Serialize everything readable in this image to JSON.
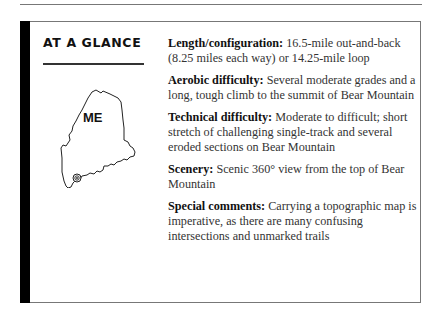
{
  "sidebar": {
    "heading": "AT A GLANCE",
    "map": {
      "state_label": "ME",
      "marker_icon": "target-location-icon"
    }
  },
  "details": [
    {
      "label": "Length/configuration:",
      "text": " 16.5-mile out-and-back (8.25 miles each way) or 14.25-mile loop"
    },
    {
      "label": "Aerobic difficulty:",
      "text": " Several moderate grades and a long, tough climb to the summit of Bear Mountain"
    },
    {
      "label": "Technical difficulty:",
      "text": " Moderate to difficult; short stretch of challenging single-track and several eroded sections on Bear Mountain"
    },
    {
      "label": "Scenery:",
      "text": " Scenic 360° view from the top of Bear Mountain"
    },
    {
      "label": "Special comments:",
      "text": " Carrying a topographic map is imperative, as there are many confusing intersections and unmarked trails"
    }
  ]
}
